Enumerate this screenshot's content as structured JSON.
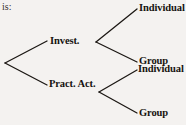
{
  "diagram": {
    "type": "binary-tree",
    "prefix_text": "is:",
    "line_color": "#1c1814",
    "text_color": "#16120f",
    "background_color": "#f4f2f0",
    "root": {
      "name": "root-node",
      "label": ""
    },
    "branches": [
      {
        "name": "invest",
        "label": "Invest.",
        "children": [
          {
            "name": "invest-individual",
            "label": "Individual"
          },
          {
            "name": "invest-group",
            "label": "Group"
          }
        ]
      },
      {
        "name": "practical-activity",
        "label": "Pract. Act.",
        "children": [
          {
            "name": "pract-individual",
            "label": "Individual"
          },
          {
            "name": "pract-group",
            "label": "Group"
          }
        ]
      }
    ],
    "leaves": [
      "Individual",
      "Group",
      "Individual",
      "Group"
    ],
    "edges": [
      {
        "name": "root-to-invest",
        "x1": 5,
        "y1": 63,
        "x2": 47,
        "y2": 41
      },
      {
        "name": "root-to-pract",
        "x1": 5,
        "y1": 63,
        "x2": 47,
        "y2": 85
      },
      {
        "name": "invest-to-individual",
        "x1": 96,
        "y1": 42,
        "x2": 137,
        "y2": 9
      },
      {
        "name": "invest-to-group",
        "x1": 96,
        "y1": 42,
        "x2": 137,
        "y2": 62
      },
      {
        "name": "pract-to-individual",
        "x1": 99,
        "y1": 92,
        "x2": 137,
        "y2": 70
      },
      {
        "name": "pract-to-group",
        "x1": 99,
        "y1": 92,
        "x2": 137,
        "y2": 113
      }
    ]
  }
}
